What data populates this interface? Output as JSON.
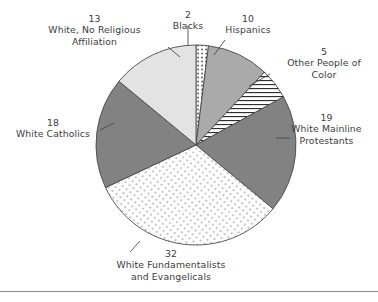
{
  "chart_data": {
    "type": "pie",
    "title": "",
    "subtitle": "",
    "xlabel": "",
    "ylabel": "",
    "legend_position": "none",
    "grid": false,
    "units": "percent",
    "total": 99,
    "categories": [
      "Blacks",
      "Hispanics",
      "Other People of Color",
      "White Mainline Protestants",
      "White Fundamentalists and Evangelicals",
      "White Catholics",
      "White, No Religious Affiliation"
    ],
    "values": [
      2,
      10,
      5,
      19,
      32,
      18,
      13
    ],
    "slices": [
      {
        "id": "blacks",
        "value": 2,
        "value_text": "2",
        "label_lines": [
          "Blacks"
        ],
        "fill": "#ffffff",
        "pattern": "vertical-dotted",
        "start_angle": 0,
        "end_angle": 7.2
      },
      {
        "id": "hispanics",
        "value": 10,
        "value_text": "10",
        "label_lines": [
          "Hispanics"
        ],
        "fill": "#aaaaaa",
        "pattern": "solid",
        "start_angle": 7.2,
        "end_angle": 43.2
      },
      {
        "id": "other-people-of-color",
        "value": 5,
        "value_text": "5",
        "label_lines": [
          "Other People of",
          "Color"
        ],
        "fill": "#ffffff",
        "pattern": "horizontal-lines",
        "start_angle": 43.2,
        "end_angle": 61.2
      },
      {
        "id": "white-mainline-protestants",
        "value": 19,
        "value_text": "19",
        "label_lines": [
          "White Mainline",
          "Protestants"
        ],
        "fill": "#828282",
        "pattern": "solid",
        "start_angle": 61.2,
        "end_angle": 129.6
      },
      {
        "id": "white-fundamentalists",
        "value": 32,
        "value_text": "32",
        "label_lines": [
          "White Fundamentalists",
          "and Evangelicals"
        ],
        "fill": "#ffffff",
        "pattern": "diagonal-dots",
        "start_angle": 129.6,
        "end_angle": 244.8
      },
      {
        "id": "white-catholics",
        "value": 18,
        "value_text": "18",
        "label_lines": [
          "White Catholics"
        ],
        "fill": "#828282",
        "pattern": "solid",
        "start_angle": 244.8,
        "end_angle": 309.6
      },
      {
        "id": "white-no-religious-affiliation",
        "value": 13,
        "value_text": "13",
        "label_lines": [
          "White, No Religious",
          "Affiliation"
        ],
        "fill": "#e3e3e3",
        "pattern": "solid",
        "start_angle": 309.6,
        "end_angle": 360
      }
    ],
    "colors": {
      "dark_gray": "#828282",
      "medium_gray": "#aaaaaa",
      "light_gray": "#e3e3e3",
      "white": "#ffffff",
      "outline": "#4a4a4a",
      "text": "#3c3c3c",
      "rule": "#8c8c8c"
    }
  },
  "labels": {
    "affiliation": {
      "value": "13",
      "line1": "White, No Religious",
      "line2": "Affiliation"
    },
    "blacks": {
      "value": "2",
      "line1": "Blacks"
    },
    "hispanics": {
      "value": "10",
      "line1": "Hispanics"
    },
    "other_color": {
      "value": "5",
      "line1": "Other People of",
      "line2": "Color"
    },
    "mainline": {
      "value": "19",
      "line1": "White Mainline",
      "line2": "Protestants"
    },
    "catholics": {
      "value": "18",
      "line1": "White Catholics"
    },
    "fundies": {
      "value": "32",
      "line1": "White Fundamentalists",
      "line2": "and Evangelicals"
    }
  }
}
